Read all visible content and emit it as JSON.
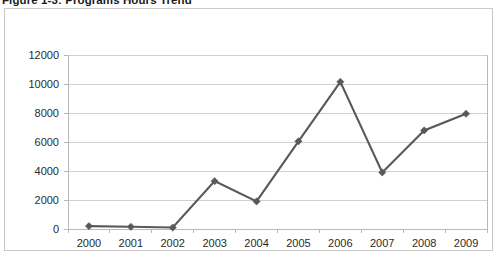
{
  "figure": {
    "caption": "Figure 1-3: Programs Hours Trend"
  },
  "chart_data": {
    "type": "line",
    "title": "Figure 1-3: Programs Hours Trend",
    "xlabel": "",
    "ylabel": "",
    "categories": [
      "2000",
      "2001",
      "2002",
      "2003",
      "2004",
      "2005",
      "2006",
      "2007",
      "2008",
      "2009"
    ],
    "values": [
      200,
      150,
      100,
      3300,
      1900,
      6050,
      10150,
      3900,
      6800,
      7950
    ],
    "series": [
      {
        "name": "Programs Hours",
        "values": [
          200,
          150,
          100,
          3300,
          1900,
          6050,
          10150,
          3900,
          6800,
          7950
        ]
      }
    ],
    "ylim": [
      0,
      12000
    ],
    "ytick_labels": [
      "0",
      "2000",
      "4000",
      "6000",
      "8000",
      "10000",
      "12000"
    ],
    "ytick_values": [
      0,
      2000,
      4000,
      6000,
      8000,
      10000,
      12000
    ],
    "xtick_labels": [
      "2000",
      "2001",
      "2002",
      "2003",
      "2004",
      "2005",
      "2006",
      "2007",
      "2008",
      "2009"
    ],
    "grid": "horizontal",
    "legend": "none",
    "marker": "diamond",
    "colors": {
      "line": "#595959",
      "marker": "#595959",
      "gridline": "#d0d0d0",
      "axis": "#b8b8b8",
      "frame_border": "#c9c9c9",
      "plot_background": "#ffffff",
      "tick_label": "#2b2b2b"
    }
  }
}
